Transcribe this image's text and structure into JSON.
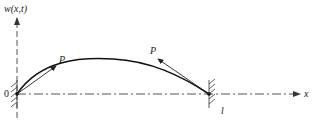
{
  "diagram": {
    "labels": {
      "y_axis": "w(x,t)",
      "x_axis": "x",
      "origin": "0",
      "length": "l",
      "force_left": "P",
      "force_right": "P"
    },
    "colors": {
      "line": "#222222",
      "axis": "#666666",
      "background": "#ffffff"
    }
  }
}
